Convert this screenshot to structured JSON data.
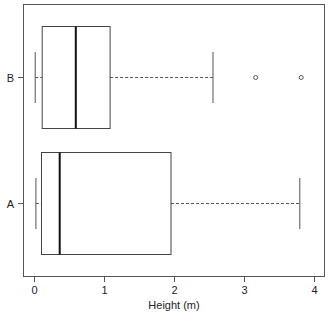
{
  "chart_data": {
    "type": "boxplot",
    "orientation": "horizontal",
    "title": "",
    "xlabel": "Height (m)",
    "ylabel": "",
    "xlim": [
      -0.17,
      4.15
    ],
    "xticks": [
      0,
      1,
      2,
      3,
      4
    ],
    "xtick_labels": [
      "0",
      "1",
      "2",
      "3",
      "4"
    ],
    "categories": [
      "A",
      "B"
    ],
    "grid": false,
    "legend": null,
    "series": [
      {
        "name": "A",
        "whisker_low": 0.02,
        "q1": 0.1,
        "median": 0.36,
        "q3": 1.95,
        "whisker_high": 3.79,
        "outliers": []
      },
      {
        "name": "B",
        "whisker_low": 0.01,
        "q1": 0.11,
        "median": 0.59,
        "q3": 1.08,
        "whisker_high": 2.55,
        "outliers": [
          3.16,
          3.81
        ]
      }
    ]
  },
  "colors": {
    "frame": "#555555",
    "box": "#444444",
    "median": "#111111",
    "whisker": "#555555",
    "outlier": "#555555"
  }
}
